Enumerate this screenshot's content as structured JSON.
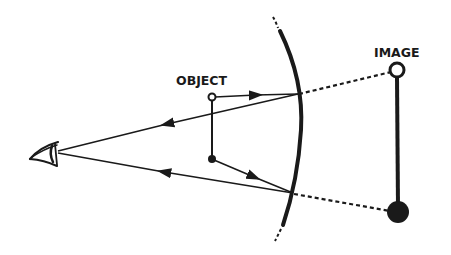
{
  "diagram": {
    "type": "convex-mirror-ray-diagram",
    "labels": {
      "object": "OBJECT",
      "image": "IMAGE"
    },
    "colors": {
      "ink": "#1a1a1a",
      "background": "#ffffff"
    },
    "elements": {
      "eye": "eye-icon",
      "mirror": "convex-mirror-arc",
      "object_top": "open-circle",
      "object_base": "filled-dot",
      "image_top": "open-circle",
      "image_base": "filled-circle"
    },
    "rays": [
      {
        "from": "object_top",
        "to": "mirror_upper",
        "then": "eye",
        "extension": "dashed-to-image-top"
      },
      {
        "from": "object_base",
        "to": "mirror_lower",
        "then": "eye",
        "extension": "dashed-to-image-base"
      }
    ]
  }
}
